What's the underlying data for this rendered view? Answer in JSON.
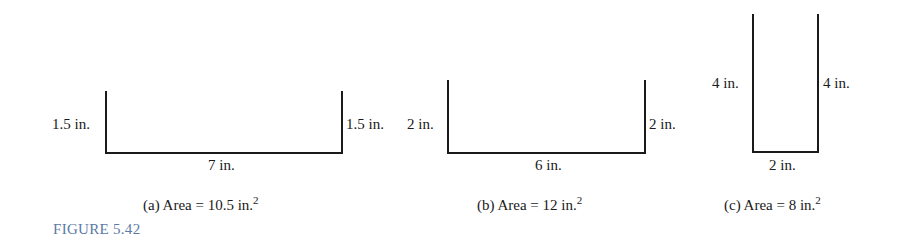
{
  "figure_label": "FIGURE 5.42",
  "panels": [
    {
      "id": "a",
      "left_side": "1.5 in.",
      "right_side": "1.5 in.",
      "bottom": "7 in.",
      "caption_prefix": "(a)  Area = 10.5 in.",
      "caption_exp": "2"
    },
    {
      "id": "b",
      "left_side": "2 in.",
      "right_side": "2 in.",
      "bottom": "6 in.",
      "caption_prefix": "(b)  Area = 12 in.",
      "caption_exp": "2"
    },
    {
      "id": "c",
      "left_side": "4 in.",
      "right_side": "4 in.",
      "bottom": "2 in.",
      "caption_prefix": "(c)  Area = 8 in.",
      "caption_exp": "2"
    }
  ]
}
